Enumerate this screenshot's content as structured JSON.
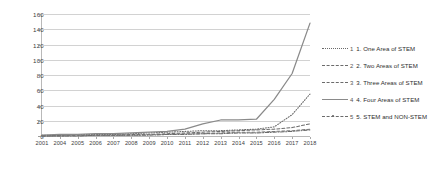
{
  "chart_data": {
    "type": "line",
    "title": "",
    "xlabel": "",
    "ylabel": "",
    "ylim": [
      0,
      160
    ],
    "yticks": [
      0,
      20,
      40,
      60,
      80,
      100,
      120,
      140,
      160
    ],
    "grid": true,
    "legend_position": "right",
    "x": [
      2001,
      2004,
      2005,
      2006,
      2007,
      2008,
      2009,
      2010,
      2011,
      2012,
      2013,
      2014,
      2015,
      2016,
      2017,
      2018
    ],
    "categories": [
      "2001",
      "2004",
      "2005",
      "2006",
      "2007",
      "2008",
      "2009",
      "2010",
      "2011",
      "2012",
      "2013",
      "2014",
      "2015",
      "2016",
      "2017",
      "2018"
    ],
    "series": [
      {
        "name": "1. One Area of STEM",
        "number": "1",
        "label": "One Area of STEM",
        "style": "dotted",
        "color": "#6b6b6b",
        "values": [
          1,
          1,
          2,
          2,
          2,
          3,
          4,
          5,
          6,
          7,
          7,
          8,
          9,
          12,
          28,
          55
        ]
      },
      {
        "name": "2. Two Areas of STEM",
        "number": "2",
        "label": "Two Areas of STEM",
        "style": "dashed",
        "color": "#6b6b6b",
        "values": [
          0,
          1,
          1,
          1,
          1,
          2,
          2,
          3,
          4,
          5,
          6,
          7,
          8,
          9,
          11,
          16
        ]
      },
      {
        "name": "3. Three Areas of STEM",
        "number": "3",
        "label": "Three Areas of STEM",
        "style": "dashed",
        "color": "#7d7d7d",
        "values": [
          0,
          0,
          1,
          1,
          1,
          1,
          2,
          2,
          3,
          3,
          4,
          5,
          5,
          6,
          7,
          9
        ]
      },
      {
        "name": "4. Four Areas of STEM",
        "number": "4",
        "label": "Four Areas of STEM",
        "style": "solid",
        "color": "#8a8a8a",
        "values": [
          1,
          2,
          2,
          3,
          3,
          4,
          5,
          6,
          9,
          16,
          21,
          21,
          22,
          48,
          82,
          148
        ]
      },
      {
        "name": "5. STEM and NON-STEM",
        "number": "5",
        "label": "STEM and NON-STEM",
        "style": "dash-dot",
        "color": "#6b6b6b",
        "values": [
          0,
          0,
          0,
          1,
          1,
          1,
          1,
          2,
          2,
          3,
          3,
          4,
          4,
          5,
          6,
          8
        ]
      }
    ]
  }
}
